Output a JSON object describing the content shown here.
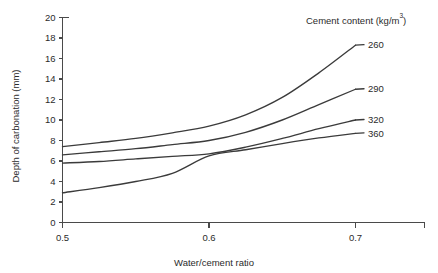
{
  "chart_data": {
    "type": "line",
    "title": "",
    "xlabel": "Water/cement ratio",
    "ylabel": "Depth of carbonation (mm)",
    "xlim": [
      0.5,
      0.7
    ],
    "ylim": [
      0,
      20
    ],
    "xticks": [
      0.5,
      0.6,
      0.7
    ],
    "xtick_labels": [
      "0.5",
      "0.6",
      "0.7"
    ],
    "yticks": [
      0,
      2,
      4,
      6,
      8,
      10,
      12,
      14,
      16,
      18,
      20
    ],
    "ytick_labels": [
      "0",
      "2",
      "4",
      "6",
      "8",
      "10",
      "12",
      "14",
      "16",
      "18",
      "20"
    ],
    "grid": false,
    "legend_position": "right-inline",
    "legend_title": "Cement content (kg/m",
    "legend_title_sup": "3",
    "legend_title_tail": ")",
    "legend_title_full": "Cement content (kg/m3)",
    "x": [
      0.5,
      0.525,
      0.55,
      0.575,
      0.6,
      0.625,
      0.65,
      0.675,
      0.7
    ],
    "series": [
      {
        "name": "260",
        "label": "260",
        "color": "#3b3b3b",
        "values": [
          7.4,
          7.8,
          8.2,
          8.75,
          9.4,
          10.5,
          12.2,
          14.6,
          17.3
        ]
      },
      {
        "name": "290",
        "label": "290",
        "color": "#3b3b3b",
        "values": [
          6.6,
          6.9,
          7.2,
          7.6,
          8.0,
          8.8,
          10.0,
          11.5,
          13.0
        ]
      },
      {
        "name": "320",
        "label": "320",
        "color": "#3b3b3b",
        "values": [
          5.8,
          5.95,
          6.2,
          6.45,
          6.7,
          7.35,
          8.2,
          9.15,
          10.0
        ]
      },
      {
        "name": "360",
        "label": "360",
        "color": "#3b3b3b",
        "values": [
          2.9,
          3.4,
          4.0,
          4.8,
          6.5,
          7.1,
          7.7,
          8.25,
          8.7
        ]
      }
    ]
  },
  "axes": {
    "y_axis_name": "Depth of carbonation (mm)",
    "x_axis_name": "Water/cement ratio"
  }
}
